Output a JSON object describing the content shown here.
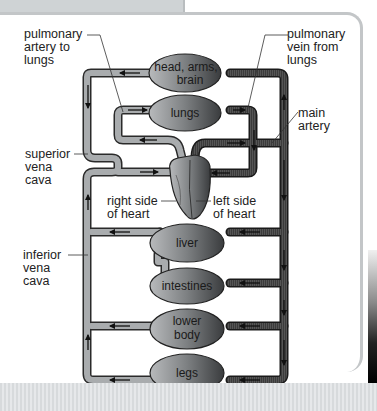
{
  "diagram": {
    "organs": {
      "head": {
        "line1": "head, arms,",
        "line2": "brain"
      },
      "lungs": {
        "label": "lungs"
      },
      "liver": {
        "label": "liver"
      },
      "intestines": {
        "label": "intestines"
      },
      "lower_body": {
        "line1": "lower",
        "line2": "body"
      },
      "legs": {
        "label": "legs"
      }
    },
    "callouts": {
      "pulmonary_artery": {
        "line1": "pulmonary",
        "line2": "artery to",
        "line3": "lungs"
      },
      "pulmonary_vein": {
        "line1": "pulmonary",
        "line2": "vein from",
        "line3": "lungs"
      },
      "main_artery": {
        "line1": "main",
        "line2": "artery"
      },
      "superior_vena_cava": {
        "line1": "superior",
        "line2": "vena",
        "line3": "cava"
      },
      "inferior_vena_cava": {
        "line1": "inferior",
        "line2": "vena",
        "line3": "cava"
      },
      "right_heart": {
        "line1": "right side",
        "line2": "of heart"
      },
      "left_heart": {
        "line1": "left side",
        "line2": "of heart"
      }
    },
    "colors": {
      "deoxygenated_vessel": "#a9acae",
      "oxygenated_vessel": "#3a3a3a",
      "vessel_outline": "#2a2a2a",
      "panel_border": "#c3c6c8"
    }
  }
}
